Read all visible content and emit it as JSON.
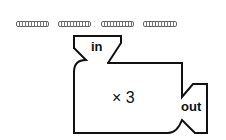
{
  "answer_blanks": {
    "count": 4,
    "bars": [
      {
        "left": 16,
        "width": 31
      },
      {
        "left": 58,
        "width": 31
      },
      {
        "left": 101,
        "width": 31
      },
      {
        "left": 143,
        "width": 32
      }
    ]
  },
  "machine": {
    "input_label": "in",
    "rule_label": "× 3",
    "output_label": "out",
    "stroke_color": "#111111"
  }
}
